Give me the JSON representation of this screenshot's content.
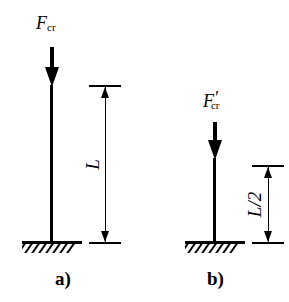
{
  "figure": {
    "background_color": "#ffffff",
    "line_color": "#000000",
    "panels": [
      {
        "caption": "a)",
        "force_symbol": "F",
        "force_subscript": "cr",
        "force_prime": "",
        "dimension_label": "L",
        "support_type": "fixed-base-hatched-ground",
        "column_orientation": "vertical",
        "load_direction": "downward-axial"
      },
      {
        "caption": "b)",
        "force_symbol": "F",
        "force_subscript": "cr",
        "force_prime": "′",
        "dimension_label": "L/2",
        "support_type": "fixed-base-hatched-ground",
        "column_orientation": "vertical",
        "load_direction": "downward-axial"
      }
    ]
  }
}
